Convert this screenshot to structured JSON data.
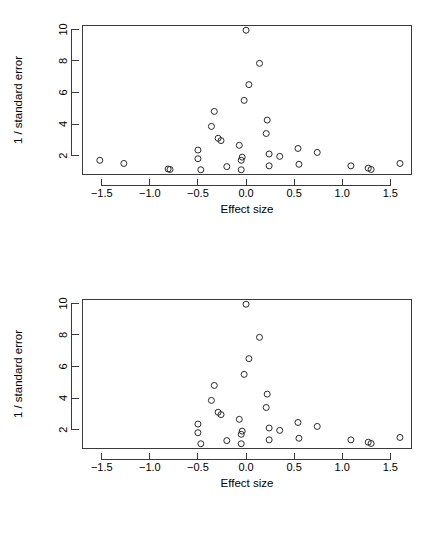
{
  "figure": {
    "panels": [
      {
        "name": "funnel-plot-all-studies",
        "xlabel": "Effect size",
        "ylabel": "1 / standard error"
      },
      {
        "name": "funnel-plot-trimmed",
        "xlabel": "Effect size",
        "ylabel": "1 / standard error"
      }
    ]
  },
  "chart_data": [
    {
      "type": "scatter",
      "title": "",
      "xlabel": "Effect size",
      "ylabel": "1 / standard error",
      "xlim": [
        -1.7,
        1.72
      ],
      "ylim": [
        0.8,
        10.25
      ],
      "xticks": [
        -1.5,
        -1.0,
        -0.5,
        0.0,
        0.5,
        1.0,
        1.5
      ],
      "xticklabels": [
        "-1.5",
        "-1.0",
        "-0.5",
        "0.0",
        "0.5",
        "1.0",
        "1.5"
      ],
      "yticks": [
        2,
        4,
        6,
        8,
        10
      ],
      "yticklabels": [
        "2",
        "4",
        "6",
        "8",
        "10"
      ],
      "grid": false,
      "legend": false,
      "marker": "open-circle",
      "points": [
        [
          -1.52,
          1.7
        ],
        [
          -1.27,
          1.5
        ],
        [
          -0.81,
          1.15
        ],
        [
          -0.79,
          1.12
        ],
        [
          -0.5,
          2.35
        ],
        [
          -0.5,
          1.8
        ],
        [
          -0.47,
          1.1
        ],
        [
          -0.33,
          4.8
        ],
        [
          -0.36,
          3.85
        ],
        [
          -0.29,
          3.1
        ],
        [
          -0.26,
          2.95
        ],
        [
          -0.2,
          1.3
        ],
        [
          -0.07,
          2.65
        ],
        [
          -0.04,
          1.9
        ],
        [
          -0.05,
          1.7
        ],
        [
          -0.05,
          1.1
        ],
        [
          -0.02,
          5.5
        ],
        [
          0.0,
          9.95
        ],
        [
          0.03,
          6.5
        ],
        [
          0.14,
          7.85
        ],
        [
          0.22,
          4.25
        ],
        [
          0.21,
          3.4
        ],
        [
          0.24,
          2.1
        ],
        [
          0.24,
          1.35
        ],
        [
          0.35,
          1.95
        ],
        [
          0.54,
          2.45
        ],
        [
          0.55,
          1.45
        ],
        [
          0.74,
          2.2
        ],
        [
          1.09,
          1.35
        ],
        [
          1.27,
          1.2
        ],
        [
          1.3,
          1.12
        ],
        [
          1.6,
          1.5
        ]
      ]
    },
    {
      "type": "scatter",
      "title": "",
      "xlabel": "Effect size",
      "ylabel": "1 / standard error",
      "xlim": [
        -1.7,
        1.72
      ],
      "ylim": [
        0.8,
        10.25
      ],
      "xticks": [
        -1.5,
        -1.0,
        -0.5,
        0.0,
        0.5,
        1.0,
        1.5
      ],
      "xticklabels": [
        "-1.5",
        "-1.0",
        "-0.5",
        "0.0",
        "0.5",
        "1.0",
        "1.5"
      ],
      "yticks": [
        2,
        4,
        6,
        8,
        10
      ],
      "yticklabels": [
        "2",
        "4",
        "6",
        "8",
        "10"
      ],
      "grid": false,
      "legend": false,
      "marker": "open-circle",
      "points": [
        [
          -0.5,
          2.35
        ],
        [
          -0.5,
          1.8
        ],
        [
          -0.47,
          1.1
        ],
        [
          -0.33,
          4.8
        ],
        [
          -0.36,
          3.85
        ],
        [
          -0.29,
          3.1
        ],
        [
          -0.26,
          2.95
        ],
        [
          -0.2,
          1.3
        ],
        [
          -0.07,
          2.65
        ],
        [
          -0.04,
          1.9
        ],
        [
          -0.05,
          1.7
        ],
        [
          -0.05,
          1.1
        ],
        [
          -0.02,
          5.5
        ],
        [
          0.0,
          9.95
        ],
        [
          0.03,
          6.5
        ],
        [
          0.14,
          7.85
        ],
        [
          0.22,
          4.25
        ],
        [
          0.21,
          3.4
        ],
        [
          0.24,
          2.1
        ],
        [
          0.24,
          1.35
        ],
        [
          0.35,
          1.95
        ],
        [
          0.54,
          2.45
        ],
        [
          0.55,
          1.45
        ],
        [
          0.74,
          2.2
        ],
        [
          1.09,
          1.35
        ],
        [
          1.27,
          1.2
        ],
        [
          1.3,
          1.12
        ],
        [
          1.6,
          1.5
        ]
      ]
    }
  ]
}
